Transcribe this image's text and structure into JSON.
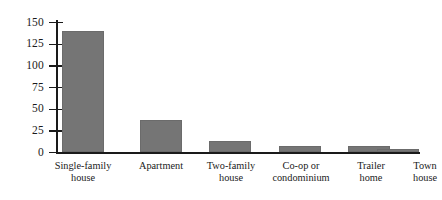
{
  "chart_data": {
    "type": "bar",
    "title": "",
    "subtitle": "",
    "xlabel": "",
    "ylabel": "",
    "categories": [
      "Single-family house",
      "Apartment",
      "Two-family house",
      "Co-op or condominium",
      "Trailer home",
      "Town house"
    ],
    "category_lines": [
      [
        "Single-family",
        "house"
      ],
      [
        "Apartment"
      ],
      [
        "Two-family",
        "house"
      ],
      [
        "Co-op or",
        "condominium"
      ],
      [
        "Trailer",
        "home"
      ],
      [
        "Town",
        "house"
      ]
    ],
    "values": [
      140,
      37,
      13,
      7,
      7,
      4
    ],
    "ylim": [
      0,
      150
    ],
    "yticks": [
      0,
      25,
      50,
      75,
      100,
      125,
      150
    ],
    "ytick_labels": [
      "0",
      "25",
      "50",
      "75",
      "100",
      "125",
      "150"
    ],
    "grid": false,
    "legend": false,
    "legend_position": "none",
    "bar_color": "#757575",
    "axis_color": "#1a1a1a",
    "background_color": "#ffffff",
    "annotations": []
  }
}
